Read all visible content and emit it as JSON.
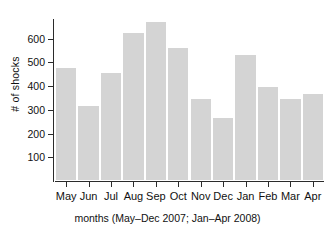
{
  "chart_data": {
    "type": "bar",
    "title": "",
    "subtitle": "",
    "xlabel": "months (May–Dec 2007; Jan–Apr 2008)",
    "ylabel": "# of shocks",
    "categories": [
      "May",
      "Jun",
      "Jul",
      "Aug",
      "Sep",
      "Oct",
      "Nov",
      "Dec",
      "Jan",
      "Feb",
      "Mar",
      "Apr"
    ],
    "values": [
      480,
      320,
      460,
      628,
      675,
      565,
      350,
      270,
      537,
      400,
      352,
      372
    ],
    "ylim": [
      0,
      700
    ],
    "yticks": [
      100,
      200,
      300,
      400,
      500,
      600
    ],
    "ytick_labels": [
      "100",
      "200",
      "300",
      "400",
      "500",
      "600"
    ],
    "grid": false,
    "legend": null,
    "legend_position": "none",
    "bar_color": "#d4d4d4",
    "bar_edge_color": "#ffffff",
    "axis_color": "#2b2b2b",
    "background_color": "#ffffff",
    "text_color": "#111111"
  }
}
